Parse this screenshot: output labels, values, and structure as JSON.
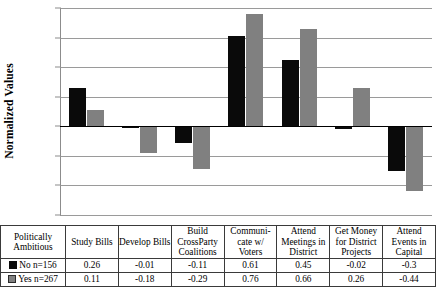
{
  "chart_data": {
    "type": "bar",
    "title": "",
    "xlabel": "",
    "ylabel": "Normalized Values",
    "ylim": [
      -0.6,
      0.8
    ],
    "ytick_step": 0.2,
    "yticks": [
      "0.8",
      "0.6",
      "0.4",
      "0.2",
      "0",
      "-0.2",
      "-0.4",
      "-0.6"
    ],
    "grid": true,
    "legend_position": "table-row-labels",
    "categories": [
      "Study Bills",
      "Develop Bills",
      "Build CrossParty Coalitions",
      "Communicate w/ Voters",
      "Attend Meetings in District",
      "Get Money for District Projects",
      "Attend Events in Capital"
    ],
    "series": [
      {
        "name": "No n=156",
        "color": "#0a0a0a",
        "values": [
          0.26,
          -0.01,
          -0.11,
          0.61,
          0.45,
          -0.02,
          -0.3
        ]
      },
      {
        "name": "Yes n=267",
        "color": "#808080",
        "values": [
          0.11,
          -0.18,
          -0.29,
          0.76,
          0.66,
          0.26,
          -0.44
        ]
      }
    ]
  },
  "table": {
    "corner_header": "Politically Ambitious",
    "column_headers": [
      "Study Bills",
      "Develop Bills",
      "Build CrossParty Coalitions",
      "Communi- cate w/ Voters",
      "Attend Meetings in District",
      "Get Money for District Projects",
      "Attend Events in Capital"
    ],
    "rows": [
      {
        "label": "No n=156",
        "swatch": "black-square",
        "values": [
          "0.26",
          "-0.01",
          "-0.11",
          "0.61",
          "0.45",
          "-0.02",
          "-0.3"
        ]
      },
      {
        "label": "Yes n=267",
        "swatch": "gray-square",
        "values": [
          "0.11",
          "-0.18",
          "-0.29",
          "0.76",
          "0.66",
          "0.26",
          "-0.44"
        ]
      }
    ]
  }
}
